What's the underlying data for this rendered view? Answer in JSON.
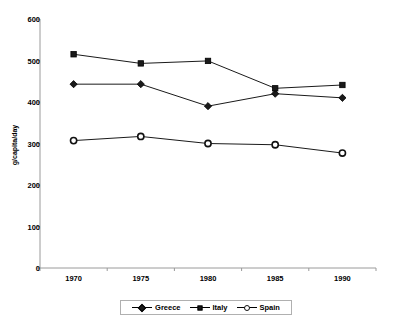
{
  "chart_data": {
    "type": "line",
    "title": "",
    "xlabel": "",
    "ylabel": "g/capita/day",
    "categories": [
      "1970",
      "1975",
      "1980",
      "1985",
      "1990"
    ],
    "x": [
      1970,
      1975,
      1980,
      1985,
      1990
    ],
    "xlim": [
      1967.5,
      1992.5
    ],
    "ylim": [
      0,
      600
    ],
    "yticks": [
      0,
      100,
      200,
      300,
      400,
      500,
      600
    ],
    "ytick_labels": [
      "0",
      "100",
      "200",
      "300",
      "400",
      "500",
      "600"
    ],
    "grid": false,
    "legend_position": "bottom",
    "series": [
      {
        "name": "Greece",
        "marker": "filled-diamond",
        "color": "#1a1a1a",
        "values": [
          443,
          443,
          390,
          420,
          410
        ]
      },
      {
        "name": "Italy",
        "marker": "filled-square",
        "color": "#1a1a1a",
        "values": [
          515,
          493,
          499,
          433,
          441
        ]
      },
      {
        "name": "Spain",
        "marker": "open-circle",
        "color": "#1a1a1a",
        "values": [
          307,
          317,
          300,
          297,
          277
        ]
      }
    ]
  },
  "legend": {
    "items": [
      {
        "label": "Greece"
      },
      {
        "label": "Italy"
      },
      {
        "label": "Spain"
      }
    ]
  },
  "axis": {
    "y_label": "g/capita/day"
  }
}
